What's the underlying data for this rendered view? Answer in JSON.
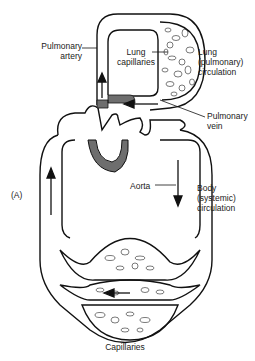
{
  "figure_label": "(A)",
  "labels": {
    "pulmonary_artery": [
      "Pulmonary",
      "artery"
    ],
    "lung_capillaries": [
      "Lung",
      "capillaries"
    ],
    "lung_circulation": [
      "Lung",
      "(pulmonary)",
      "circulation"
    ],
    "pulmonary_vein": [
      "Pulmonary",
      "vein"
    ],
    "aorta": "Aorta",
    "body_circulation": [
      "Body",
      "(systemic)",
      "circulation"
    ],
    "capillaries": "Capillaries"
  },
  "colors": {
    "stroke": "#111111",
    "heart_fill": "#6e6e6e",
    "background": "#ffffff"
  }
}
